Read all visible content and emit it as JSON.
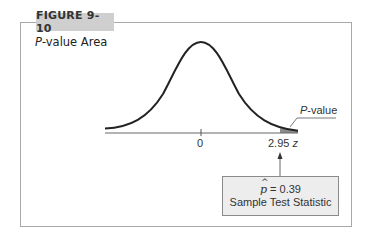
{
  "figure": {
    "number_label": "FIGURE 9-10",
    "title_italic": "P",
    "title_rest": "-value Area"
  },
  "axis": {
    "tick_zero": "0",
    "tick_stat_value": "2.95",
    "variable": "z"
  },
  "shaded_region": {
    "label_italic": "P",
    "label_rest": "-value",
    "fill_color": "#8c8c8c"
  },
  "callout": {
    "statistic_symbol": "p",
    "statistic_eq": " = 0.39",
    "caption": "Sample Test Statistic",
    "fill_color": "#ededed"
  },
  "colors": {
    "frame_border": "#a8a8a8",
    "tab_background": "#cfcfcf",
    "curve": "#222222",
    "axis": "#555555"
  }
}
